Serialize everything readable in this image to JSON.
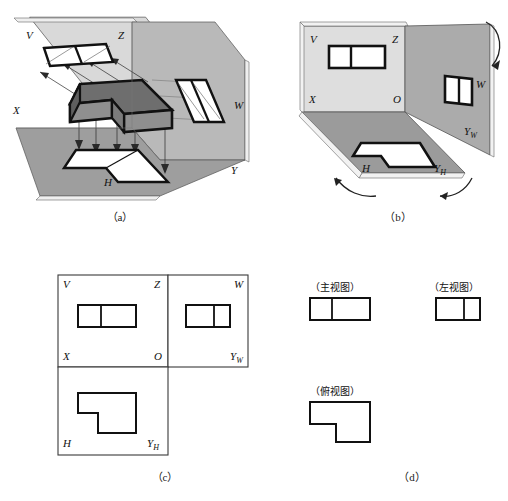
{
  "figure": {
    "subfigures": [
      {
        "id": "a",
        "caption": "（a）",
        "description": "三投影面体系中L形物体的三面投影"
      },
      {
        "id": "b",
        "caption": "（b）",
        "description": "投影面展开，H面与W面旋转"
      },
      {
        "id": "c",
        "caption": "（c）",
        "description": "展开后的三面投影图"
      },
      {
        "id": "d",
        "caption": "（d）",
        "description": "三视图"
      }
    ]
  },
  "panel_a": {
    "caption": "（a）",
    "plane_labels": [
      {
        "name": "V",
        "text": "V"
      },
      {
        "name": "Z",
        "text": "Z"
      },
      {
        "name": "X",
        "text": "X"
      },
      {
        "name": "W",
        "text": "W"
      },
      {
        "name": "H",
        "text": "H"
      },
      {
        "name": "Y",
        "text": "Y"
      }
    ],
    "colors": {
      "v_plane": "#d9d9d9",
      "w_plane": "#b5b5b5",
      "h_plane": "#9e9e9e",
      "solid_top": "#6e6e6e",
      "solid_front": "#8a8a8a",
      "solid_side": "#7a7a7a",
      "outline": "#111111",
      "projection_ray": "#333333"
    }
  },
  "panel_b": {
    "caption": "（b）",
    "plane_labels": [
      {
        "name": "V",
        "text": "V"
      },
      {
        "name": "Z",
        "text": "Z"
      },
      {
        "name": "X",
        "text": "X"
      },
      {
        "name": "O",
        "text": "O"
      },
      {
        "name": "W",
        "text": "W"
      },
      {
        "name": "Yw",
        "text": "Y",
        "sub": "W"
      },
      {
        "name": "H",
        "text": "H"
      },
      {
        "name": "Yh",
        "text": "Y",
        "sub": "H"
      }
    ],
    "colors": {
      "v_plane": "#dddddd",
      "w_plane": "#a8a8a8",
      "h_plane": "#9a9a9a",
      "outline": "#111111",
      "rotation_arrow": "#222222"
    }
  },
  "panel_c": {
    "caption": "（c）",
    "quadrant_labels": [
      {
        "name": "V",
        "text": "V"
      },
      {
        "name": "Z",
        "text": "Z"
      },
      {
        "name": "W",
        "text": "W"
      },
      {
        "name": "X",
        "text": "X"
      },
      {
        "name": "O",
        "text": "O"
      },
      {
        "name": "Yw",
        "text": "Y",
        "sub": "W"
      },
      {
        "name": "H",
        "text": "H"
      },
      {
        "name": "Yh",
        "text": "Y",
        "sub": "H"
      }
    ],
    "colors": {
      "frame": "#3a3a3a",
      "axis": "#3a3a3a",
      "shape": "#111111"
    }
  },
  "panel_d": {
    "caption": "（d）",
    "views": [
      {
        "name": "front-view",
        "label": "（主视图）"
      },
      {
        "name": "left-view",
        "label": "（左视图）"
      },
      {
        "name": "top-view",
        "label": "（俯视图）"
      }
    ],
    "colors": {
      "shape": "#111111"
    }
  }
}
